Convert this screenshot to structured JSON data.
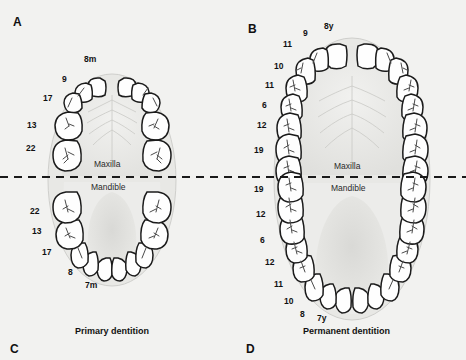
{
  "figure": {
    "background_color": "#f2f2f0",
    "divider": {
      "name": "occlusal-dashed-line",
      "style": "dashed",
      "color": "#1a1a1a",
      "y": 177
    }
  },
  "panels": [
    {
      "id": "A",
      "letter": "A",
      "letter_pos": {
        "x": 13,
        "y": 15
      },
      "caption": "Primary dentition",
      "caption_pos": {
        "x": 75,
        "y": 326
      },
      "arch": {
        "cx": 112,
        "cy": 180,
        "rx": 64,
        "ry": 106
      },
      "jaw_labels": [
        {
          "text": "Maxilla",
          "x": 94,
          "y": 160
        },
        {
          "text": "Mandible",
          "x": 91,
          "y": 183
        }
      ],
      "teeth_per_quadrant": 5,
      "eruption_labels_maxilla": [
        {
          "text": "8m",
          "x": 84,
          "y": 55
        },
        {
          "text": "9",
          "x": 62,
          "y": 75
        },
        {
          "text": "17",
          "x": 43,
          "y": 94
        },
        {
          "text": "13",
          "x": 27,
          "y": 121
        },
        {
          "text": "22",
          "x": 26,
          "y": 144
        }
      ],
      "eruption_labels_mandible": [
        {
          "text": "22",
          "x": 30,
          "y": 207
        },
        {
          "text": "13",
          "x": 32,
          "y": 227
        },
        {
          "text": "17",
          "x": 42,
          "y": 248
        },
        {
          "text": "8",
          "x": 68,
          "y": 268
        },
        {
          "text": "7m",
          "x": 85,
          "y": 281
        }
      ]
    },
    {
      "id": "B",
      "letter": "B",
      "letter_pos": {
        "x": 248,
        "y": 22
      },
      "caption": "Permanent dentition",
      "caption_pos": {
        "x": 303,
        "y": 326
      },
      "arch": {
        "cx": 352,
        "cy": 179,
        "rx": 78,
        "ry": 141
      },
      "jaw_labels": [
        {
          "text": "Maxilla",
          "x": 334,
          "y": 162
        },
        {
          "text": "Mandible",
          "x": 331,
          "y": 184
        }
      ],
      "teeth_per_quadrant": 8,
      "eruption_labels_maxilla": [
        {
          "text": "8y",
          "x": 324,
          "y": 22
        },
        {
          "text": "9",
          "x": 303,
          "y": 29
        },
        {
          "text": "11",
          "x": 283,
          "y": 40
        },
        {
          "text": "10",
          "x": 274,
          "y": 62
        },
        {
          "text": "11",
          "x": 265,
          "y": 81
        },
        {
          "text": "6",
          "x": 262,
          "y": 101
        },
        {
          "text": "12",
          "x": 257,
          "y": 121
        },
        {
          "text": "19",
          "x": 254,
          "y": 146
        }
      ],
      "eruption_labels_mandible": [
        {
          "text": "19",
          "x": 254,
          "y": 185
        },
        {
          "text": "12",
          "x": 256,
          "y": 210
        },
        {
          "text": "6",
          "x": 260,
          "y": 236
        },
        {
          "text": "12",
          "x": 265,
          "y": 258
        },
        {
          "text": "11",
          "x": 274,
          "y": 280
        },
        {
          "text": "10",
          "x": 284,
          "y": 297
        },
        {
          "text": "8",
          "x": 300,
          "y": 310
        },
        {
          "text": "7y",
          "x": 317,
          "y": 314
        }
      ]
    }
  ],
  "bottom_letters": [
    {
      "text": "C",
      "x": 10,
      "y": 342
    },
    {
      "text": "D",
      "x": 246,
      "y": 342
    }
  ],
  "colors": {
    "tooth_outline": "#1b1b1b",
    "tooth_fill": "#ffffff",
    "gum_fill": "#e6e6e4",
    "palate_fill": "#ededeb",
    "text": "#111111",
    "page_bg": "#f2f2f0"
  }
}
